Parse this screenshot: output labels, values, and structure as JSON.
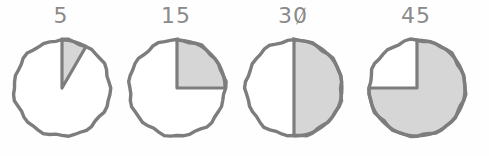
{
  "figure": {
    "title": "",
    "background_color": "#fefefe",
    "stroke_color": "#7d7d7d",
    "fill_color": "#d6d6d6",
    "empty_color": "#ffffff",
    "label_color": "#8a8a8a"
  },
  "chart_data": {
    "type": "pie",
    "title": "",
    "xlabel": "",
    "ylabel": "",
    "total_minutes": 60,
    "start_angle_deg": 0,
    "direction": "clockwise",
    "legend": [],
    "charts": [
      {
        "label": "5",
        "value": 5,
        "fraction": 0.0833,
        "sweep_deg": 30,
        "slashed_zero": false,
        "slices": [
          {
            "name": "elapsed",
            "value": 5,
            "color": "#d6d6d6"
          },
          {
            "name": "remaining",
            "value": 55,
            "color": "#ffffff"
          }
        ]
      },
      {
        "label": "15",
        "value": 15,
        "fraction": 0.25,
        "sweep_deg": 90,
        "slashed_zero": false,
        "slices": [
          {
            "name": "elapsed",
            "value": 15,
            "color": "#d6d6d6"
          },
          {
            "name": "remaining",
            "value": 45,
            "color": "#ffffff"
          }
        ]
      },
      {
        "label": "30",
        "value": 30,
        "fraction": 0.5,
        "sweep_deg": 180,
        "slashed_zero": true,
        "slices": [
          {
            "name": "elapsed",
            "value": 30,
            "color": "#d6d6d6"
          },
          {
            "name": "remaining",
            "value": 30,
            "color": "#ffffff"
          }
        ]
      },
      {
        "label": "45",
        "value": 45,
        "fraction": 0.75,
        "sweep_deg": 270,
        "slashed_zero": false,
        "slices": [
          {
            "name": "elapsed",
            "value": 45,
            "color": "#d6d6d6"
          },
          {
            "name": "remaining",
            "value": 15,
            "color": "#ffffff"
          }
        ]
      }
    ]
  }
}
